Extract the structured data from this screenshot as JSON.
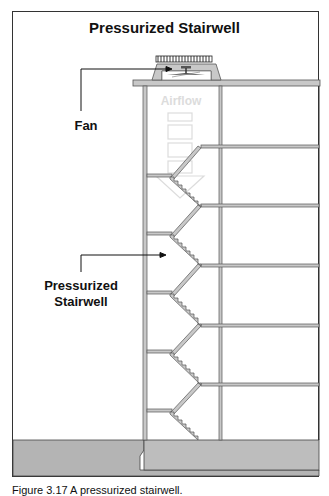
{
  "figure": {
    "title": "Pressurized Stairwell",
    "labels": {
      "fan": "Fan",
      "airflow": "Airflow",
      "stairwell_line1": "Pressurized",
      "stairwell_line2": "Stairwell"
    },
    "caption": "Figure 3.17 A pressurized stairwell."
  },
  "colors": {
    "wall_fill": "#c8c8c8",
    "wall_stroke": "#555555",
    "ground_fill": "#b4b4b4",
    "airflow": "#e3e3e3",
    "line": "#222222"
  },
  "structure": {
    "floors_right_y": [
      146,
      205,
      265,
      325,
      385
    ],
    "landings_left_y": [
      175,
      233,
      292,
      352,
      410
    ]
  }
}
